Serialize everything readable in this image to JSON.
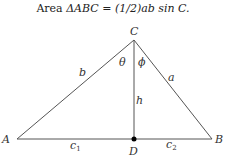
{
  "title": {
    "prefix": "Area ",
    "expr": "ΔABC = (1/2)ab sin C."
  },
  "diagram": {
    "type": "triangle",
    "vertices": {
      "A": {
        "label": "A",
        "x": 17,
        "y": 139
      },
      "B": {
        "label": "B",
        "x": 212,
        "y": 139
      },
      "C": {
        "label": "C",
        "x": 134,
        "y": 40
      },
      "D": {
        "label": "D",
        "x": 134,
        "y": 139
      }
    },
    "side_labels": {
      "a": "a",
      "b": "b",
      "h": "h",
      "c1": "c",
      "c1_sub": "1",
      "c2": "c",
      "c2_sub": "2"
    },
    "angle_labels": {
      "theta": "θ",
      "phi": "ϕ"
    },
    "line_color": "#555555",
    "point_color": "#000000"
  }
}
